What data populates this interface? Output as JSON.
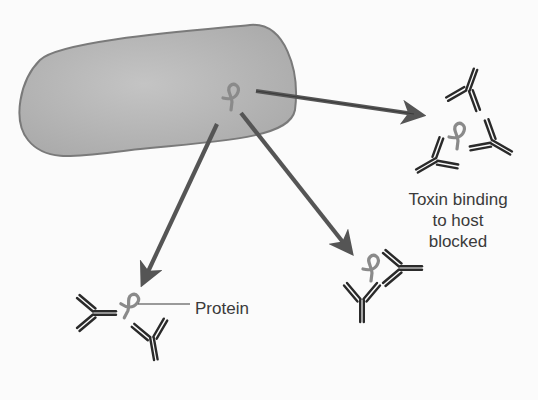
{
  "diagram": {
    "colors": {
      "background": "#fbfbfb",
      "cell_fill": "#b8b8b8",
      "cell_stroke": "#7a7a7a",
      "arrow": "#555555",
      "antibody": "#2a2a2a",
      "toxin": "#8a8a8a",
      "text": "#3a3a3a"
    },
    "nodes": [
      {
        "id": "bacterium",
        "type": "rod-shaped cell",
        "label": ""
      },
      {
        "id": "toxin-source",
        "type": "toxin protein inside cell",
        "label": ""
      },
      {
        "id": "neutralized-complex",
        "type": "toxin surrounded by three antibodies",
        "label": "Toxin binding to host blocked"
      },
      {
        "id": "agglutinated-complex",
        "type": "protein bound by two antibodies",
        "label": "Protein"
      },
      {
        "id": "bound-complex",
        "type": "toxin bound by two antibodies",
        "label": ""
      }
    ],
    "edges": [
      {
        "from": "toxin-source",
        "to": "neutralized-complex"
      },
      {
        "from": "toxin-source",
        "to": "agglutinated-complex"
      },
      {
        "from": "toxin-source",
        "to": "bound-complex"
      }
    ]
  },
  "labels": {
    "toxin_line1": "Toxin binding",
    "toxin_line2": "to host",
    "toxin_line3": "blocked",
    "protein": "Protein"
  }
}
